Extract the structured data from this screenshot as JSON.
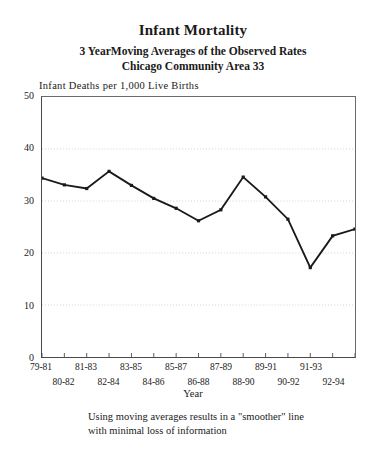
{
  "figure": {
    "title": "Infant Mortality",
    "subtitle_1": "3 YearMoving Averages of the Observed Rates",
    "subtitle_2": "Chicago Community Area 33",
    "caption_line_1": "Using moving averages results in a \"smoother\" line",
    "caption_line_2": "with minimal loss of information",
    "line_color": "#1a1a1a",
    "grid_color": "#c8c8c8",
    "axis_color": "#4a4a4a"
  },
  "chart_data": {
    "type": "line",
    "title": "Infant Mortality",
    "subtitle": "3 YearMoving Averages of the Observed Rates — Chicago Community Area 33",
    "xlabel": "Year",
    "ylabel": "Infant Deaths per 1,000 Live Births",
    "ylim": [
      0,
      50
    ],
    "yticks": [
      0,
      10,
      20,
      30,
      40,
      50
    ],
    "grid": true,
    "legend": "none",
    "categories": [
      "79-81",
      "80-82",
      "81-83",
      "82-84",
      "83-85",
      "84-86",
      "85-87",
      "86-88",
      "87-89",
      "88-90",
      "89-91",
      "90-92",
      "91-93",
      "92-94"
    ],
    "values": [
      34.4,
      33.1,
      32.4,
      35.7,
      33.0,
      30.5,
      28.6,
      26.2,
      28.3,
      34.6,
      30.8,
      26.5,
      17.2,
      23.3
    ],
    "series": [
      {
        "name": "3 Year Moving Average",
        "values": [
          34.4,
          33.1,
          32.4,
          35.7,
          33.0,
          30.5,
          28.6,
          26.2,
          28.3,
          34.6,
          30.8,
          26.5,
          17.2,
          23.3
        ]
      }
    ],
    "extra_point": {
      "value": 24.6,
      "note": "final marker at right plot edge"
    }
  },
  "axes": {
    "y_tick_labels": [
      "50",
      "40",
      "30",
      "20",
      "10",
      "0"
    ],
    "x_tick_labels_row_top": [
      "79-81",
      "81-83",
      "83-85",
      "85-87",
      "87-89",
      "89-91",
      "91-93"
    ],
    "x_tick_labels_row_bottom": [
      "80-82",
      "82-84",
      "84-86",
      "86-88",
      "88-90",
      "90-92",
      "92-94"
    ],
    "x_title": "Year"
  }
}
